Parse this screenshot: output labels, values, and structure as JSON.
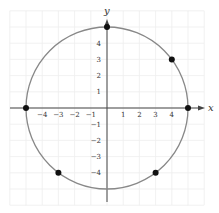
{
  "chart_data": {
    "type": "scatter",
    "title": "",
    "xlabel": "x",
    "ylabel": "y",
    "xlim": [
      -6,
      6
    ],
    "ylim": [
      -6,
      6
    ],
    "grid": true,
    "x_ticks": [
      -4,
      -3,
      -2,
      -1,
      1,
      2,
      3,
      4
    ],
    "y_ticks": [
      4,
      3,
      2,
      1,
      -1,
      -2,
      -3,
      -4
    ],
    "x_tick_labels": [
      "-4",
      "-3",
      "-2",
      "-1",
      "1",
      "2",
      "3",
      "4"
    ],
    "y_tick_labels": [
      "4",
      "3",
      "2",
      "1",
      "-1",
      "-2",
      "-3",
      "-4"
    ],
    "curve": {
      "shape": "circle",
      "center": [
        0,
        0
      ],
      "radius": 5,
      "equation": "x^2 + y^2 = 25"
    },
    "points": [
      {
        "x": 0,
        "y": 5
      },
      {
        "x": 4,
        "y": 3
      },
      {
        "x": 5,
        "y": 0
      },
      {
        "x": -5,
        "y": 0
      },
      {
        "x": -3,
        "y": -4
      },
      {
        "x": 3,
        "y": -4
      }
    ]
  },
  "colors": {
    "grid": "#eeeeee",
    "axis": "#444444",
    "circle": "#888888",
    "point": "#111111",
    "background": "#ffffff"
  },
  "layout": {
    "origin_px": [
      107,
      108
    ],
    "unit_px": 16.2
  }
}
